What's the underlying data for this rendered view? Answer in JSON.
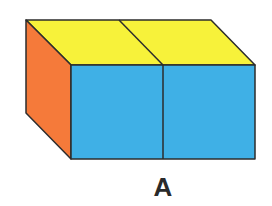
{
  "figure": {
    "label": "A",
    "colors": {
      "top": "#f7f23a",
      "front": "#3fb0e6",
      "side": "#f57a3a",
      "edge": "#2d2d2d"
    },
    "cubes": 2
  }
}
